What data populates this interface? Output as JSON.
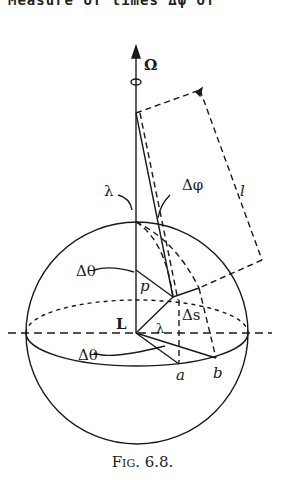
{
  "header": {
    "cropped_text": "Measure of times Δφ of"
  },
  "diagram": {
    "labels": {
      "omega": "Ω",
      "lambda_top": "λ",
      "delta_phi": "Δφ",
      "length": "l",
      "delta_theta_top": "Δθ",
      "p": "p",
      "delta_s": "Δs",
      "L": "L",
      "lambda_bottom": "λ",
      "delta_theta_bottom": "Δθ",
      "a": "a",
      "b": "b"
    }
  },
  "caption": "Fig. 6.8."
}
